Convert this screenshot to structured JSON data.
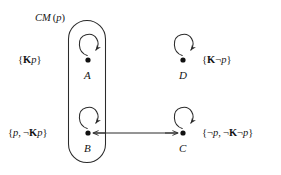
{
  "figure": {
    "type": "kripke-model-diagram",
    "background_color": "#ffffff",
    "stroke_color": "#2b2b2b",
    "region": {
      "label": "CM(p)",
      "label_head": "CM",
      "label_arg": "(p)",
      "shape": "stadium",
      "contains": [
        "A",
        "B"
      ]
    },
    "nodes": [
      {
        "id": "A",
        "name": "A",
        "x": 88,
        "y": 60,
        "valuation": "{Kp}",
        "valuation_parts": [
          {
            "text": "{",
            "style": "plain"
          },
          {
            "text": "K",
            "style": "bold"
          },
          {
            "text": "p",
            "style": "italic"
          },
          {
            "text": "}",
            "style": "plain"
          }
        ],
        "valuation_side": "left",
        "self_loop": true,
        "inside_region": true
      },
      {
        "id": "D",
        "name": "D",
        "x": 183,
        "y": 60,
        "valuation": "{K¬p}",
        "valuation_parts": [
          {
            "text": "{",
            "style": "plain"
          },
          {
            "text": "K",
            "style": "bold"
          },
          {
            "text": "¬",
            "style": "plain"
          },
          {
            "text": "p",
            "style": "italic"
          },
          {
            "text": "}",
            "style": "plain"
          }
        ],
        "valuation_side": "right",
        "self_loop": true,
        "inside_region": false
      },
      {
        "id": "B",
        "name": "B",
        "x": 88,
        "y": 133,
        "valuation": "{p, ¬Kp}",
        "valuation_parts": [
          {
            "text": "{",
            "style": "plain"
          },
          {
            "text": "p",
            "style": "italic"
          },
          {
            "text": ", ",
            "style": "plain"
          },
          {
            "text": "¬",
            "style": "plain"
          },
          {
            "text": "K",
            "style": "bold"
          },
          {
            "text": "p",
            "style": "italic"
          },
          {
            "text": "}",
            "style": "plain"
          }
        ],
        "valuation_side": "left",
        "self_loop": true,
        "inside_region": true
      },
      {
        "id": "C",
        "name": "C",
        "x": 183,
        "y": 133,
        "valuation": "{¬p, ¬K¬p}",
        "valuation_parts": [
          {
            "text": "{",
            "style": "plain"
          },
          {
            "text": "¬",
            "style": "plain"
          },
          {
            "text": "p",
            "style": "italic"
          },
          {
            "text": ", ",
            "style": "plain"
          },
          {
            "text": "¬",
            "style": "plain"
          },
          {
            "text": "K",
            "style": "bold"
          },
          {
            "text": "¬",
            "style": "plain"
          },
          {
            "text": "p",
            "style": "italic"
          },
          {
            "text": "}",
            "style": "plain"
          }
        ],
        "valuation_side": "right",
        "self_loop": true,
        "inside_region": false
      }
    ],
    "edges": [
      {
        "from": "B",
        "to": "C",
        "kind": "bidirectional",
        "style": "straight-horizontal"
      },
      {
        "from": "A",
        "to": "A",
        "kind": "self-loop"
      },
      {
        "from": "B",
        "to": "B",
        "kind": "self-loop"
      },
      {
        "from": "C",
        "to": "C",
        "kind": "self-loop"
      },
      {
        "from": "D",
        "to": "D",
        "kind": "self-loop"
      }
    ],
    "labels": {
      "region": "CM(p)",
      "a_set": "{Kp}",
      "d_set": "{K¬p}",
      "b_set": "{p, ¬Kp}",
      "c_set": "{¬p, ¬K¬p}",
      "a_name": "A",
      "b_name": "B",
      "c_name": "C",
      "d_name": "D"
    }
  }
}
